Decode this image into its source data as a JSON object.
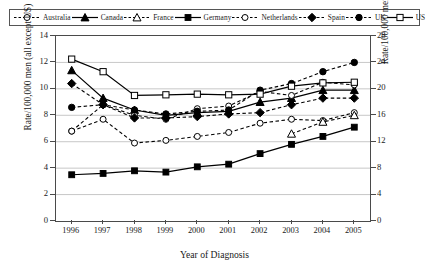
{
  "chart_data": {
    "type": "line",
    "title": "",
    "xlabel": "Year of Diagnosis",
    "ylabel": "Rate/100,000 men (all except US)",
    "ylabel_right": "Rate/100,000 men (US)",
    "categories": [
      "1996",
      "1997",
      "1998",
      "1999",
      "2000",
      "2001",
      "2002",
      "2003",
      "2004",
      "2005"
    ],
    "ylim": [
      0,
      14
    ],
    "yticks": [
      "0",
      "2",
      "4",
      "6",
      "8",
      "10",
      "12",
      "14"
    ],
    "ylim_right": [
      0,
      28
    ],
    "yticks_right": [
      "0",
      "4",
      "8",
      "12",
      "16",
      "20",
      "24",
      "28"
    ],
    "grid": true,
    "legend_position": "top",
    "series": [
      {
        "name": "Australia",
        "axis": "left",
        "line": "dashed",
        "marker": "open-circle",
        "values": [
          6.8,
          7.7,
          5.9,
          6.1,
          6.4,
          6.7,
          7.4,
          7.7,
          7.6,
          8.2
        ]
      },
      {
        "name": "Canada",
        "axis": "left",
        "line": "solid",
        "marker": "filled-triangle",
        "values": [
          11.4,
          9.3,
          8.4,
          8.0,
          8.2,
          8.3,
          9.0,
          9.3,
          9.9,
          9.9
        ]
      },
      {
        "name": "France",
        "axis": "left",
        "line": "dashed",
        "marker": "open-triangle",
        "values": [
          null,
          null,
          null,
          null,
          null,
          null,
          null,
          6.6,
          7.5,
          8.0
        ]
      },
      {
        "name": "Germany",
        "axis": "left",
        "line": "solid",
        "marker": "filled-square",
        "values": [
          3.5,
          3.6,
          3.8,
          3.7,
          4.1,
          4.3,
          5.1,
          5.8,
          6.4,
          7.1
        ]
      },
      {
        "name": "Netherlands",
        "axis": "left",
        "line": "dashed",
        "marker": "open-circle",
        "values": [
          6.8,
          8.8,
          8.0,
          7.7,
          8.5,
          8.7,
          9.8,
          9.5,
          10.5,
          10.3
        ]
      },
      {
        "name": "Spain",
        "axis": "left",
        "line": "dashed",
        "marker": "filled-diamond",
        "values": [
          10.4,
          8.8,
          7.8,
          7.8,
          7.9,
          8.1,
          8.2,
          8.8,
          9.3,
          9.3
        ]
      },
      {
        "name": "UK",
        "axis": "left",
        "line": "dashed",
        "marker": "filled-circle",
        "values": [
          8.6,
          8.8,
          8.4,
          8.1,
          8.3,
          8.4,
          9.9,
          10.4,
          11.3,
          12.0
        ]
      },
      {
        "name": "US",
        "axis": "right",
        "line": "solid",
        "marker": "open-square",
        "values": [
          24.5,
          22.6,
          19.0,
          19.1,
          19.2,
          19.1,
          19.2,
          20.4,
          20.9,
          21.0
        ]
      }
    ]
  },
  "legend": {
    "items": [
      {
        "label": "Australia",
        "icon": "open-circle-marker",
        "line": "dashed"
      },
      {
        "label": "Canada",
        "icon": "filled-triangle-marker",
        "line": "solid"
      },
      {
        "label": "France",
        "icon": "open-triangle-marker",
        "line": "dashed"
      },
      {
        "label": "Germany",
        "icon": "filled-square-marker",
        "line": "solid"
      },
      {
        "label": "Netherlands",
        "icon": "open-circle-marker",
        "line": "dashed"
      },
      {
        "label": "Spain",
        "icon": "filled-diamond-marker",
        "line": "dashed"
      },
      {
        "label": "UK",
        "icon": "filled-circle-marker",
        "line": "dashed"
      },
      {
        "label": "US",
        "icon": "open-square-marker",
        "line": "solid"
      }
    ]
  },
  "colors": {
    "series": "#000000",
    "axis": "#4a4a4a",
    "grid": "#b9b9b9",
    "background": "#ffffff"
  }
}
